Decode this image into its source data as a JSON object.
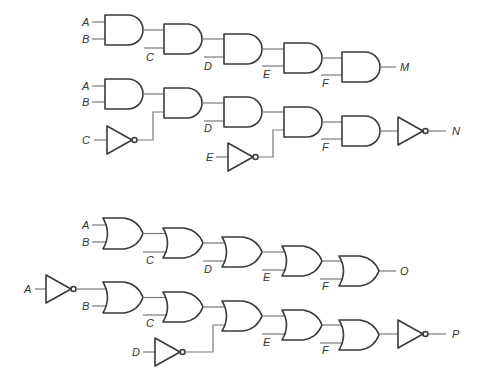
{
  "diagram": {
    "type": "logic-circuits",
    "circuits": [
      {
        "id": "M",
        "gate_type": "AND",
        "output_label": "M",
        "inputs": [
          "A",
          "B",
          "C",
          "D",
          "E",
          "F"
        ],
        "inverted_inputs": [],
        "output_inverted": false
      },
      {
        "id": "N",
        "gate_type": "AND",
        "output_label": "N",
        "inputs": [
          "A",
          "B",
          "C",
          "D",
          "E",
          "F"
        ],
        "inverted_inputs": [
          "C",
          "E"
        ],
        "output_inverted": true
      },
      {
        "id": "O",
        "gate_type": "OR",
        "output_label": "O",
        "inputs": [
          "A",
          "B",
          "C",
          "D",
          "E",
          "F"
        ],
        "inverted_inputs": [],
        "output_inverted": false
      },
      {
        "id": "P",
        "gate_type": "OR",
        "output_label": "P",
        "inputs": [
          "A",
          "B",
          "C",
          "D",
          "E",
          "F"
        ],
        "inverted_inputs": [
          "A",
          "D"
        ],
        "output_inverted": true
      }
    ]
  },
  "labels": {
    "a": "A",
    "b": "B",
    "c": "C",
    "d": "D",
    "e": "E",
    "f": "F",
    "m": "M",
    "n": "N",
    "o": "O",
    "p": "P"
  }
}
